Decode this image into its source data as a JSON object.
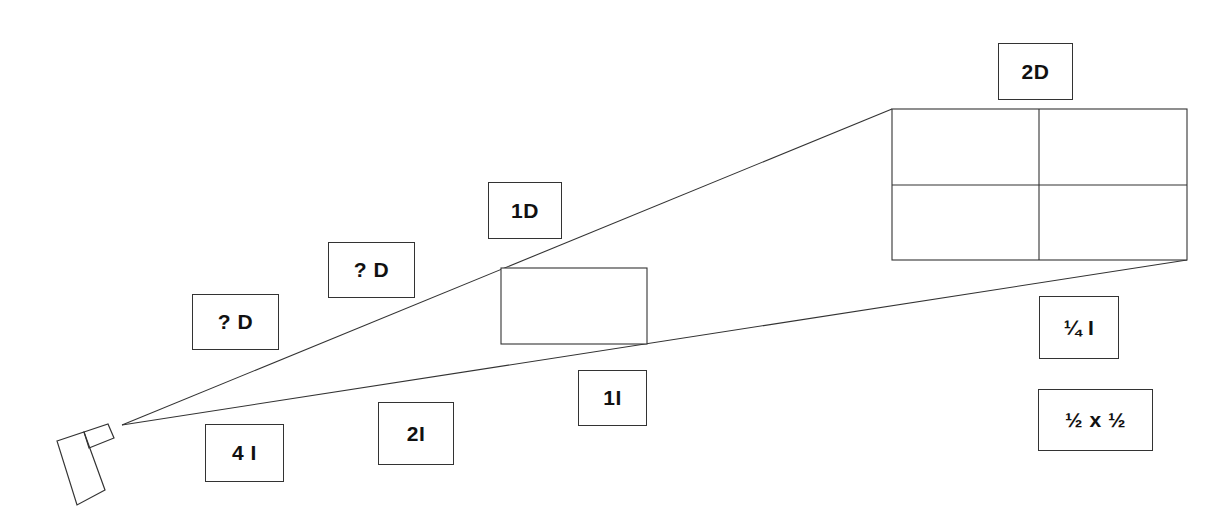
{
  "diagram": {
    "colors": {
      "line": "#333333",
      "text": "#111111",
      "background": "#ffffff"
    },
    "source": {
      "name": "light-source",
      "shape": "flashlight"
    },
    "labels": {
      "distance_unknown_1": "? D",
      "distance_unknown_2": "? D",
      "distance_1": "1D",
      "distance_2": "2D",
      "intensity_4": "4 I",
      "intensity_2": "2I",
      "intensity_1": "1I",
      "intensity_quarter": "¼ I",
      "area_factor": "½ x ½"
    },
    "surfaces": [
      {
        "name": "surface-at-1D",
        "grid": "1x1"
      },
      {
        "name": "surface-at-2D",
        "grid": "2x2"
      }
    ]
  }
}
